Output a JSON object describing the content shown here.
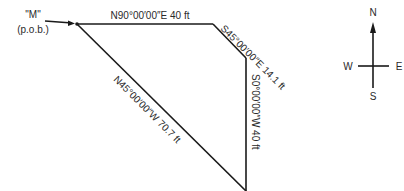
{
  "point_of_beginning": {
    "name": "\"M\"",
    "subtitle": "(p.o.b.)"
  },
  "courses": [
    {
      "bearing": "N90°00′00″E",
      "distance": "40 ft",
      "label": "N90°00′00″E 40 ft"
    },
    {
      "bearing": "S45°00′00″E",
      "distance": "14.1 ft",
      "label": "S45°00′00″E 14.1 ft"
    },
    {
      "bearing": "S0°00′00″W",
      "distance": "40 ft",
      "label": "S0°00′00″W 40 ft"
    },
    {
      "bearing": "N45°00′00″W",
      "distance": "70.7 ft",
      "label": "N45°00′00″W 70.7 ft"
    }
  ],
  "compass": {
    "north": "N",
    "south": "S",
    "east": "E",
    "west": "W"
  },
  "colors": {
    "line": "#1a1a1a",
    "text": "#2a2a2a",
    "background": "#ffffff"
  }
}
